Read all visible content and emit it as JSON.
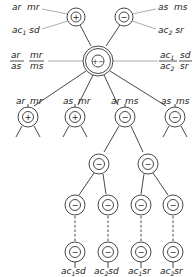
{
  "diagram": {
    "type": "tree",
    "top_nodes": [
      {
        "id": "top-plus",
        "symbol": "+",
        "labels": [
          {
            "main": "ar",
            "rest": "mr"
          },
          {
            "main": "ac",
            "sub": "1",
            "rest": "sd"
          }
        ]
      },
      {
        "id": "top-minus",
        "symbol": "−",
        "labels": [
          {
            "main": "as",
            "rest": "ms"
          },
          {
            "main": "ac",
            "sub": "2",
            "rest": "sr"
          }
        ]
      }
    ],
    "center_node": {
      "symbol": "+−",
      "left_fraction": {
        "num1": "ar",
        "den1": "as",
        "num2": "mr",
        "den2": "ms"
      },
      "right_fraction": {
        "num1": "ac",
        "num1_sub": "1",
        "den1": "ac",
        "den1_sub": "2",
        "num2": "sd",
        "den2": "sr"
      }
    },
    "level2": [
      {
        "label_a": "ar",
        "label_b": "mr",
        "symbol": "+"
      },
      {
        "label_a": "as",
        "label_b": "mr",
        "symbol": "+"
      },
      {
        "label_a": "ar",
        "label_b": "ms",
        "symbol": "−"
      },
      {
        "label_a": "as",
        "label_b": "ms",
        "symbol": "−"
      }
    ],
    "level3": [
      {
        "symbol": "−"
      },
      {
        "symbol": "−"
      }
    ],
    "level4": [
      {
        "symbol": "−"
      },
      {
        "symbol": "−"
      },
      {
        "symbol": "−"
      },
      {
        "symbol": "−"
      }
    ],
    "level5": [
      {
        "symbol": "−",
        "label": "ac",
        "sub": "1",
        "rest": "sd"
      },
      {
        "symbol": "−",
        "label": "ac",
        "sub": "2",
        "rest": "sd"
      },
      {
        "symbol": "−",
        "label": "ac",
        "sub": "1",
        "rest": "sr"
      },
      {
        "symbol": "−",
        "label": "ac",
        "sub": "2",
        "rest": "sr"
      }
    ]
  }
}
